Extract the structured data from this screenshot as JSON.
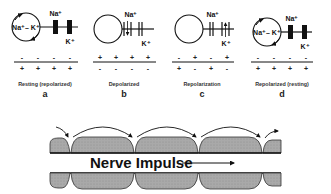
{
  "panels": [
    {
      "id": "a",
      "letter": "a",
      "caption": "Resting (repolarized)",
      "pump_label": "Na⁺– K⁺",
      "pump_active": true,
      "na_label": "Na⁺",
      "k_label": "K⁺",
      "na_channel": "closed",
      "k_channel": "closed",
      "outside_charges": [
        "-",
        "-",
        "-",
        "-"
      ],
      "inside_charges": [
        "+",
        "+",
        "+",
        "+"
      ]
    },
    {
      "id": "b",
      "letter": "b",
      "caption": "Depolarized",
      "pump_label": "",
      "pump_active": false,
      "na_label": "Na⁺",
      "k_label": "K⁺",
      "na_channel": "open-inward",
      "k_channel": "closed",
      "outside_charges": [
        "+",
        "+",
        "+",
        "+"
      ],
      "inside_charges": [
        "-",
        "-",
        "-",
        "-"
      ]
    },
    {
      "id": "c",
      "letter": "c",
      "caption": "Repolarization",
      "pump_label": "",
      "pump_active": false,
      "na_label": "Na⁺",
      "k_label": "K⁺",
      "na_channel": "closed",
      "k_channel": "open-outward",
      "outside_charges": [
        "-",
        "+",
        "-",
        "+"
      ],
      "inside_charges": [
        "+",
        "-",
        "+",
        "-"
      ]
    },
    {
      "id": "d",
      "letter": "d",
      "caption": "Repolarized (resting)",
      "pump_label": "Na⁺– K⁺",
      "pump_active": true,
      "na_label": "Na⁺",
      "k_label": "K⁺",
      "na_channel": "closed",
      "k_channel": "closed",
      "outside_charges": [
        "-",
        "-",
        "-",
        "-"
      ],
      "inside_charges": [
        "+",
        "+",
        "+",
        "+"
      ]
    }
  ],
  "nerve": {
    "label": "Nerve Impulse",
    "direction": "right",
    "segments": 4,
    "fill_color": "#a8a8a8",
    "line_color": "#111111"
  }
}
